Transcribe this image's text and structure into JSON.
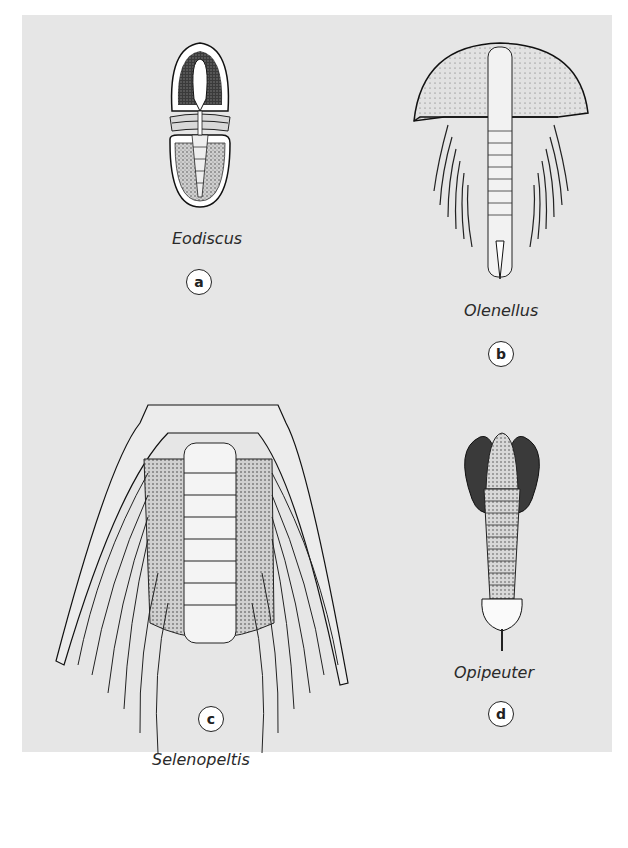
{
  "figure": {
    "background_color": "#e6e6e6",
    "specimens": [
      {
        "id": "a",
        "name": "Eodiscus"
      },
      {
        "id": "b",
        "name": "Olenellus"
      },
      {
        "id": "c",
        "name": "Selenopeltis"
      },
      {
        "id": "d",
        "name": "Opipeuter"
      }
    ]
  }
}
